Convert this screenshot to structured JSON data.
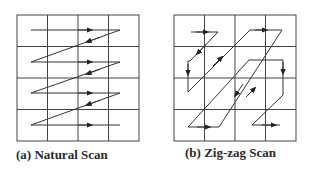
{
  "panels": [
    {
      "id": "natural-scan",
      "caption": "(a) Natural Scan",
      "grid": {
        "rows": 4,
        "cols": 4
      },
      "path_cells": [
        [
          0,
          0
        ],
        [
          0,
          1
        ],
        [
          0,
          2
        ],
        [
          0,
          3
        ],
        [
          1,
          0
        ],
        [
          1,
          1
        ],
        [
          1,
          2
        ],
        [
          1,
          3
        ],
        [
          2,
          0
        ],
        [
          2,
          1
        ],
        [
          2,
          2
        ],
        [
          2,
          3
        ],
        [
          3,
          0
        ],
        [
          3,
          1
        ],
        [
          3,
          2
        ],
        [
          3,
          3
        ]
      ]
    },
    {
      "id": "zigzag-scan",
      "caption": "(b) Zig-zag Scan",
      "grid": {
        "rows": 4,
        "cols": 4
      },
      "path_cells": [
        [
          0,
          0
        ],
        [
          0,
          1
        ],
        [
          1,
          0
        ],
        [
          2,
          0
        ],
        [
          1,
          1
        ],
        [
          0,
          2
        ],
        [
          0,
          3
        ],
        [
          1,
          2
        ],
        [
          2,
          1
        ],
        [
          3,
          0
        ],
        [
          3,
          1
        ],
        [
          2,
          2
        ],
        [
          1,
          3
        ],
        [
          2,
          3
        ],
        [
          3,
          2
        ],
        [
          3,
          3
        ]
      ]
    }
  ],
  "colors": {
    "line": "#333333",
    "grid": "#444444",
    "text": "#2a2a2a"
  }
}
